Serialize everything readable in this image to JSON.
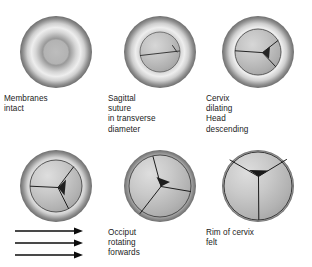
{
  "diagram": {
    "background_color": "#ffffff",
    "ink_color": "#1b1b1b",
    "rim_dark_color": "#767676",
    "rim_light_color": "#e9e9e9",
    "head_fill_color": "#b4b4b4",
    "panels": [
      {
        "id": "panel-membranes-intact",
        "name": "membranes-intact",
        "caption": "Membranes\nintact",
        "order": 1,
        "row": 1,
        "column": 1,
        "outer_radius": 36,
        "inner_radius": 13,
        "suture": "none",
        "dilatation_stage": "closed"
      },
      {
        "id": "panel-sagittal-suture",
        "name": "sagittal-suture-transverse",
        "caption": "Sagittal\nsuture\nin transverse\ndiameter",
        "order": 2,
        "row": 1,
        "column": 2,
        "outer_radius": 36,
        "inner_radius": 20,
        "suture": "transverse-line",
        "dilatation_stage": "early"
      },
      {
        "id": "panel-cervix-dilating",
        "name": "cervix-dilating-head-descending",
        "caption": "Cervix\ndilating\nHead\ndescending",
        "order": 3,
        "row": 1,
        "column": 3,
        "outer_radius": 36,
        "inner_radius": 23,
        "suture": "y-transverse",
        "dilatation_stage": "dilating"
      },
      {
        "id": "panel-rotation-begins",
        "name": "head-rotating",
        "caption": "",
        "order": 4,
        "row": 2,
        "column": 1,
        "outer_radius": 36,
        "inner_radius": 26,
        "suture": "y-rotated-left",
        "dilatation_stage": "advanced"
      },
      {
        "id": "panel-occiput-rotating",
        "name": "occiput-rotating-forwards",
        "caption": "Occiput\nrotating\nforwards",
        "order": 5,
        "row": 2,
        "column": 2,
        "outer_radius": 36,
        "inner_radius": 31,
        "suture": "y-rotated-mid",
        "dilatation_stage": "nearly-full"
      },
      {
        "id": "panel-rim-of-cervix",
        "name": "rim-of-cervix-felt",
        "caption": "Rim of cervix\nfelt",
        "order": 6,
        "row": 2,
        "column": 3,
        "outer_radius": 36,
        "inner_radius": 34,
        "suture": "lambda-inverted-y",
        "dilatation_stage": "full"
      }
    ],
    "arrows": {
      "name": "descent-direction-arrows",
      "count": 3,
      "direction": "right",
      "label": ""
    }
  }
}
